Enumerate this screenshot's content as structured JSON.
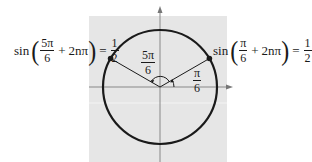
{
  "diagram": {
    "type": "unit-circle",
    "colors": {
      "panel": "#e6e6e6",
      "stroke": "#1a1a1a",
      "axis": "#888888"
    },
    "angles": {
      "left": {
        "num": "5π",
        "den": "6"
      },
      "right": {
        "num": "π",
        "den": "6"
      }
    },
    "equations": {
      "left": {
        "fn": "sin",
        "frac_num": "5π",
        "frac_den": "6",
        "plus": "+",
        "term": "2nπ",
        "eq": "=",
        "val_num": "1",
        "val_den": "2"
      },
      "right": {
        "fn": "sin",
        "frac_num": "π",
        "frac_den": "6",
        "plus": "+",
        "term": "2nπ",
        "eq": "=",
        "val_num": "1",
        "val_den": "2"
      }
    }
  }
}
